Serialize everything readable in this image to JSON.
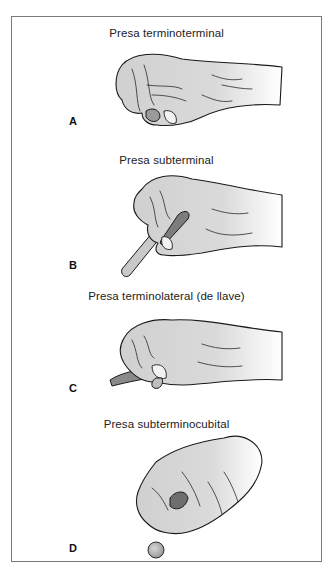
{
  "figure": {
    "panels": [
      {
        "letter": "A",
        "caption": "Presa terminoterminal",
        "object": "none (fingertip-to-fingertip pinch)"
      },
      {
        "letter": "B",
        "caption": "Presa subterminal",
        "object": "stick"
      },
      {
        "letter": "C",
        "caption": "Presa terminolateral (de llave)",
        "object": "flat key-like card"
      },
      {
        "letter": "D",
        "caption": "Presa subterminocubital",
        "object": "small round ball"
      }
    ],
    "colors": {
      "border": "#7a7a7a",
      "skin_shade": "#d4d4d4",
      "ink": "#1a1a1a",
      "object_fill": "#c9c9c9"
    }
  }
}
